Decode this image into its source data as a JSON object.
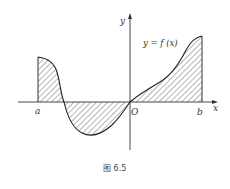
{
  "figure": {
    "caption": "图 6.5",
    "function_label": "y = f (x)",
    "axis_labels": {
      "x": "x",
      "y": "y",
      "origin": "O"
    },
    "interval_labels": {
      "a": "a",
      "b": "b"
    },
    "colors": {
      "stroke": "#333333",
      "hatch": "#444444",
      "background": "#ffffff"
    },
    "regions": [
      {
        "name": "positive-left",
        "sign": "+",
        "from": "a",
        "to": "first-root"
      },
      {
        "name": "negative-middle",
        "sign": "-",
        "from": "first-root",
        "to": "O"
      },
      {
        "name": "positive-right",
        "sign": "+",
        "from": "O",
        "to": "b"
      }
    ]
  }
}
